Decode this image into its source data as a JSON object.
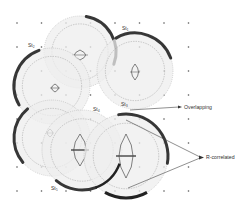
{
  "diagram": {
    "stations": [
      {
        "id": "st1",
        "label": "St₁"
      },
      {
        "id": "st2",
        "label": "St₂"
      },
      {
        "id": "st3",
        "label": "St₃"
      },
      {
        "id": "st4",
        "label": "St₄"
      },
      {
        "id": "st5",
        "label": "St₅"
      }
    ],
    "callouts": {
      "overlapping": "Overlapping",
      "r_correlated": "R-correlated"
    },
    "colors": {
      "circle_fill": "#eeeeee",
      "dark_arc": "#222222",
      "dashed": "#888888",
      "grid_dot": "#555555",
      "arrow": "#444444"
    }
  }
}
